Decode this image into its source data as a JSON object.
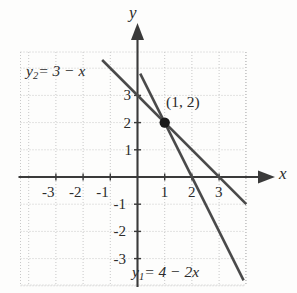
{
  "figure": {
    "kind": "coordinate-graph",
    "background_color": "#fdfdfc",
    "line_color": "#4a4a4a",
    "axis_color": "#3a3a3a",
    "grid_color": "#c8c8c8",
    "text_color": "#2b2b2b",
    "axis_labels": {
      "x": "x",
      "y": "y"
    },
    "x_ticks": [
      "-3",
      "-2",
      "-1",
      "1",
      "2",
      "3"
    ],
    "y_ticks": [
      "3",
      "2",
      "1",
      "-1",
      "-2",
      "-3"
    ],
    "equation_label_1": {
      "var": "y",
      "sub": "2",
      "rhs": "= 3 − x"
    },
    "equation_label_2": {
      "var": "y",
      "sub": "1",
      "rhs": "= 4 − 2x"
    },
    "intersection_label": "(1, 2)"
  },
  "chart_data": {
    "type": "line",
    "title": "",
    "xlabel": "x",
    "ylabel": "y",
    "xlim": [
      -3.5,
      4.0
    ],
    "ylim": [
      -3.6,
      4.6
    ],
    "grid": true,
    "grid_step": 1,
    "legend": "inline-annotations",
    "xticks": [
      -3,
      -2,
      -1,
      1,
      2,
      3
    ],
    "yticks": [
      3,
      2,
      1,
      -1,
      -2,
      -3
    ],
    "series": [
      {
        "name": "y1 = 4 - 2x",
        "label": "y₁ = 4 − 2x",
        "slope": -2,
        "intercept": 4,
        "color": "#4a4a4a",
        "points": [
          [
            0.1,
            3.8
          ],
          [
            1,
            2
          ],
          [
            2,
            0
          ],
          [
            3,
            -2
          ],
          [
            3.9,
            -3.8
          ]
        ]
      },
      {
        "name": "y2 = 3 - x",
        "label": "y₂ = 3 − x",
        "slope": -1,
        "intercept": 3,
        "color": "#4a4a4a",
        "points": [
          [
            -1.3,
            4.3
          ],
          [
            0,
            3
          ],
          [
            1,
            2
          ],
          [
            2,
            1
          ],
          [
            3,
            0
          ],
          [
            4.0,
            -1.0
          ]
        ]
      }
    ],
    "annotations": [
      {
        "text": "(1, 2)",
        "x": 1,
        "y": 2,
        "type": "point-label"
      }
    ],
    "markers": [
      {
        "x": 1,
        "y": 2,
        "style": "filled-circle",
        "color": "#1a1a1a"
      }
    ]
  }
}
